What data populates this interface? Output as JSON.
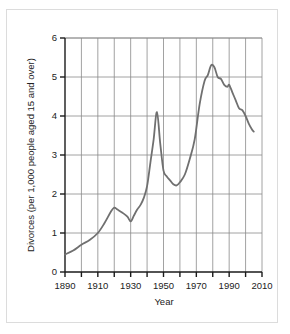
{
  "chart_data": {
    "type": "line",
    "title": "",
    "xlabel": "Year",
    "ylabel": "Divorces (per 1,000 people aged 15 and over)",
    "xlim": [
      1890,
      2010
    ],
    "ylim": [
      0,
      6
    ],
    "xticks": [
      1890,
      1900,
      1910,
      1920,
      1930,
      1940,
      1950,
      1960,
      1970,
      1980,
      1990,
      2000,
      2010
    ],
    "xticklabels": [
      "1890",
      "",
      "1910",
      "",
      "1930",
      "",
      "1950",
      "",
      "1970",
      "",
      "1990",
      "",
      "2010"
    ],
    "xtick_major_labels": [
      "1890",
      "1910",
      "1930",
      "1950",
      "1970",
      "1990",
      "2010"
    ],
    "yticks": [
      0,
      1,
      2,
      3,
      4,
      5,
      6
    ],
    "yticklabels": [
      "0",
      "1",
      "2",
      "3",
      "4",
      "5",
      "6"
    ],
    "grid": "both",
    "legend": "none",
    "line_color": "#707070",
    "grid_color": "#8a8a8a",
    "axis_color": "#1a1a1a",
    "series": [
      {
        "name": "Divorce rate",
        "x": [
          1890,
          1895,
          1900,
          1905,
          1910,
          1914,
          1918,
          1920,
          1922,
          1925,
          1928,
          1930,
          1932,
          1934,
          1936,
          1938,
          1940,
          1942,
          1944,
          1946,
          1948,
          1950,
          1952,
          1954,
          1956,
          1958,
          1960,
          1963,
          1966,
          1969,
          1972,
          1975,
          1977,
          1979,
          1981,
          1983,
          1985,
          1987,
          1989,
          1990,
          1992,
          1994,
          1996,
          1998,
          2000,
          2002,
          2004,
          2005
        ],
        "y": [
          0.45,
          0.55,
          0.7,
          0.82,
          1.0,
          1.25,
          1.55,
          1.65,
          1.6,
          1.52,
          1.42,
          1.3,
          1.45,
          1.6,
          1.72,
          1.9,
          2.2,
          2.8,
          3.4,
          4.1,
          3.3,
          2.6,
          2.45,
          2.35,
          2.25,
          2.22,
          2.3,
          2.5,
          2.9,
          3.4,
          4.3,
          4.9,
          5.05,
          5.3,
          5.25,
          5.0,
          4.95,
          4.8,
          4.75,
          4.8,
          4.6,
          4.4,
          4.2,
          4.15,
          4.0,
          3.8,
          3.65,
          3.6
        ]
      }
    ]
  },
  "axes": {
    "y_label_text": "Divorces (per 1,000 people aged 15 and over)",
    "x_label_text": "Year"
  }
}
